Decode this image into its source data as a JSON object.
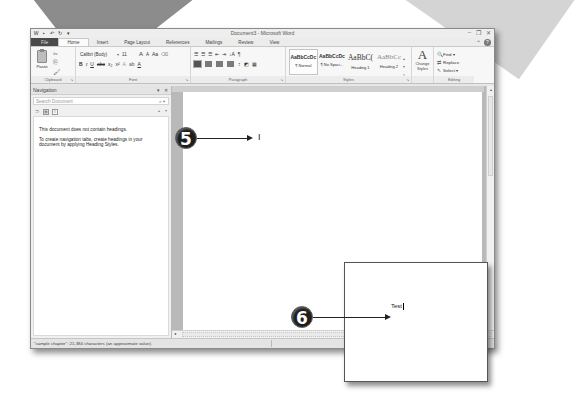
{
  "window": {
    "title": "Document3 - Microsoft Word",
    "qat_icons": [
      "word-icon",
      "save-icon",
      "undo-icon",
      "redo-icon",
      "customize-qat-icon"
    ],
    "controls": {
      "minimize": "▭",
      "restore": "🗗",
      "close": "☒"
    }
  },
  "ribbon_tabs": [
    {
      "label": "File"
    },
    {
      "label": "Home",
      "active": true
    },
    {
      "label": "Insert"
    },
    {
      "label": "Page Layout"
    },
    {
      "label": "References"
    },
    {
      "label": "Mailings"
    },
    {
      "label": "Review"
    },
    {
      "label": "View"
    }
  ],
  "ribbon": {
    "clipboard": {
      "label": "Clipboard",
      "paste": "Paste"
    },
    "font": {
      "label": "Font",
      "font_name": "Calibri (Body)",
      "font_size": "11",
      "grow": "A",
      "shrink": "A",
      "change_case": "Aa",
      "bold": "B",
      "italic": "I",
      "underline": "U",
      "strike": "abc",
      "subscript": "x₂",
      "superscript": "x²",
      "font_color": "A"
    },
    "paragraph": {
      "label": "Paragraph",
      "show_marks": "¶",
      "sort": "↓A"
    },
    "styles": {
      "label": "Styles",
      "items": [
        {
          "sample": "AaBbCcDc",
          "name": "¶ Normal",
          "selected": true
        },
        {
          "sample": "AaBbCcDc",
          "name": "¶ No Spaci..."
        },
        {
          "sample": "AaBbC(",
          "name": "Heading 1"
        },
        {
          "sample": "AaBbCc",
          "name": "Heading 2"
        }
      ],
      "change_styles": "Change Styles"
    },
    "editing": {
      "label": "Editing",
      "find": "Find",
      "replace": "Replace",
      "select": "Select"
    }
  },
  "navigation": {
    "title": "Navigation",
    "search_placeholder": "Search Document",
    "message_1": "This document does not contain headings.",
    "message_2": "To create navigation tabs, create headings in your document by applying Heading Styles."
  },
  "document": {
    "cursor_marker": "I"
  },
  "status_bar": {
    "text": "\"sample chapter\": 21,384 characters (an approximate value)."
  },
  "callouts": [
    {
      "number": "5"
    },
    {
      "number": "6"
    }
  ],
  "zoom_inset": {
    "text": "Test"
  }
}
